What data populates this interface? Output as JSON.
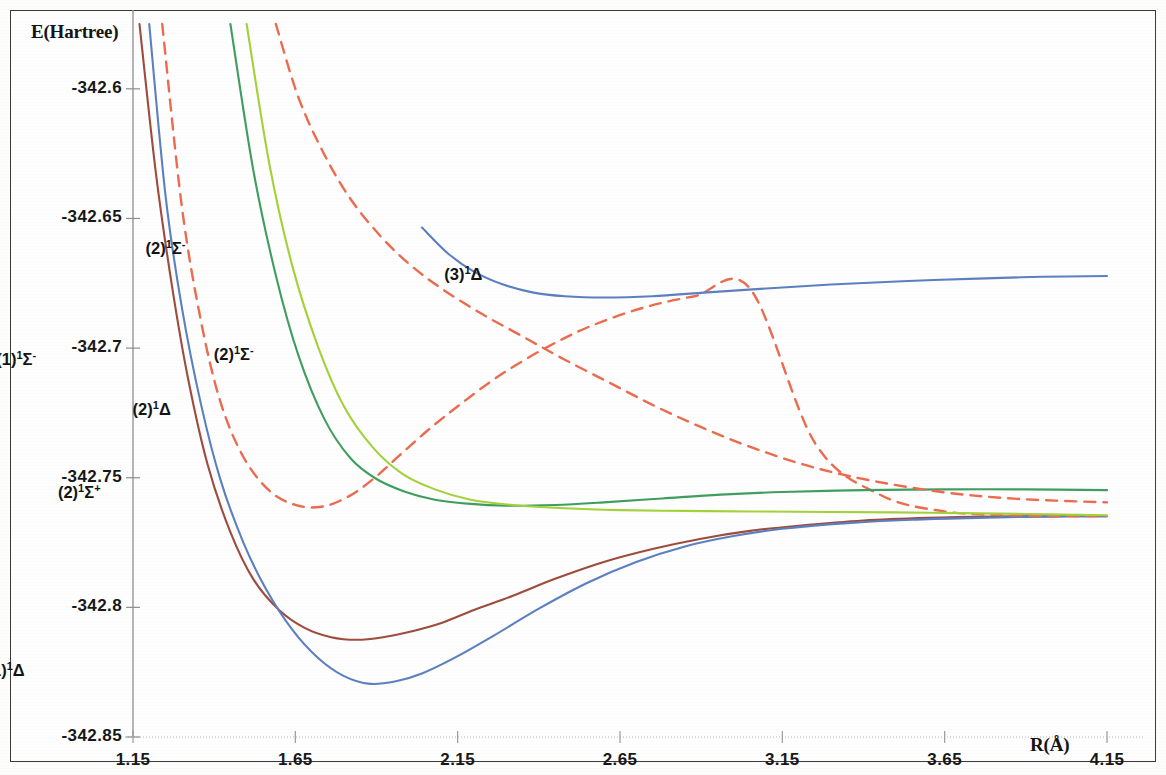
{
  "chart_data": {
    "type": "line",
    "title": "",
    "xlabel": "R(Å)",
    "ylabel": "E(Hartree)",
    "xlim": [
      1.15,
      4.15
    ],
    "ylim": [
      -342.85,
      -342.575
    ],
    "xticks": [
      "1.15",
      "1.65",
      "2.15",
      "2.65",
      "3.15",
      "3.65",
      "4.15"
    ],
    "xtick_values": [
      1.15,
      1.65,
      2.15,
      2.65,
      3.15,
      3.65,
      4.15
    ],
    "yticks": [
      "-342.6",
      "-342.65",
      "-342.7",
      "-342.75",
      "-342.8",
      "-342.85"
    ],
    "ytick_values": [
      -342.6,
      -342.65,
      -342.7,
      -342.75,
      -342.8,
      -342.85
    ],
    "grid": false,
    "legend": "inline-annotations",
    "series": [
      {
        "name": "(1)¹Σ⁺",
        "label_html": "(1)<sup>1</sup>Σ<sup>+</sup>",
        "color": "#9e4b3c",
        "style": "solid",
        "width": 2.1,
        "label_x": 0.545,
        "label_y": -342.8005,
        "points": [
          [
            1.17,
            -342.575
          ],
          [
            1.22,
            -342.632
          ],
          [
            1.27,
            -342.676
          ],
          [
            1.32,
            -342.712
          ],
          [
            1.38,
            -342.745
          ],
          [
            1.45,
            -342.771
          ],
          [
            1.52,
            -342.789
          ],
          [
            1.6,
            -342.801
          ],
          [
            1.68,
            -342.808
          ],
          [
            1.76,
            -342.8115
          ],
          [
            1.84,
            -342.8125
          ],
          [
            1.92,
            -342.8115
          ],
          [
            2.0,
            -342.8095
          ],
          [
            2.1,
            -342.806
          ],
          [
            2.2,
            -342.801
          ],
          [
            2.32,
            -342.7955
          ],
          [
            2.45,
            -342.789
          ],
          [
            2.6,
            -342.7825
          ],
          [
            2.75,
            -342.7775
          ],
          [
            2.9,
            -342.7735
          ],
          [
            3.05,
            -342.7705
          ],
          [
            3.2,
            -342.7685
          ],
          [
            3.4,
            -342.7665
          ],
          [
            3.6,
            -342.7655
          ],
          [
            3.8,
            -342.765
          ],
          [
            4.0,
            -342.7648
          ],
          [
            4.15,
            -342.7648
          ]
        ]
      },
      {
        "name": "(1)¹Δ",
        "label_html": "(1)<sup>1</sup>Δ",
        "color": "#5b7fc0",
        "style": "solid",
        "width": 2.1,
        "label_x": 0.705,
        "label_y": -342.8255,
        "points": [
          [
            1.2,
            -342.575
          ],
          [
            1.25,
            -342.641
          ],
          [
            1.3,
            -342.684
          ],
          [
            1.36,
            -342.722
          ],
          [
            1.42,
            -342.751
          ],
          [
            1.49,
            -342.775
          ],
          [
            1.56,
            -342.793
          ],
          [
            1.64,
            -342.8085
          ],
          [
            1.72,
            -342.8195
          ],
          [
            1.8,
            -342.8265
          ],
          [
            1.88,
            -342.8295
          ],
          [
            1.96,
            -342.8285
          ],
          [
            2.04,
            -342.8255
          ],
          [
            2.14,
            -342.8195
          ],
          [
            2.26,
            -342.811
          ],
          [
            2.4,
            -342.8005
          ],
          [
            2.55,
            -342.7905
          ],
          [
            2.7,
            -342.7825
          ],
          [
            2.85,
            -342.7765
          ],
          [
            3.0,
            -342.7725
          ],
          [
            3.15,
            -342.7697
          ],
          [
            3.35,
            -342.7675
          ],
          [
            3.55,
            -342.7662
          ],
          [
            3.75,
            -342.7655
          ],
          [
            3.95,
            -342.765
          ],
          [
            4.15,
            -342.7648
          ]
        ]
      },
      {
        "name": "(2)¹Σ⁺",
        "label_html": "(2)<sup>1</sup>Σ<sup>+</sup>",
        "color": "#ec6b4e",
        "style": "dashed",
        "width": 2.4,
        "label_x": 0.925,
        "label_y": -342.7565,
        "points": [
          [
            1.24,
            -342.575
          ],
          [
            1.3,
            -342.645
          ],
          [
            1.36,
            -342.69
          ],
          [
            1.42,
            -342.721
          ],
          [
            1.49,
            -342.742
          ],
          [
            1.57,
            -342.755
          ],
          [
            1.65,
            -342.7605
          ],
          [
            1.73,
            -342.7612
          ],
          [
            1.81,
            -342.7575
          ],
          [
            1.89,
            -342.7505
          ],
          [
            1.97,
            -342.7415
          ],
          [
            2.06,
            -342.7315
          ],
          [
            2.16,
            -342.7215
          ],
          [
            2.28,
            -342.7105
          ],
          [
            2.42,
            -342.7
          ],
          [
            2.56,
            -342.6915
          ],
          [
            2.72,
            -342.6845
          ],
          [
            2.88,
            -342.68
          ],
          [
            3.05,
            -342.677
          ],
          [
            3.25,
            -342.7365
          ],
          [
            3.45,
            -342.7565
          ],
          [
            3.65,
            -342.763
          ],
          [
            3.85,
            -342.7645
          ],
          [
            4.05,
            -342.7648
          ],
          [
            4.15,
            -342.7648
          ]
        ],
        "note": "upper branch crosses from repulsive wall to dissociation limit"
      },
      {
        "name": "(1)¹Σ⁻",
        "label_html": "(1)<sup>1</sup>Σ<sup>-</sup>",
        "color": "#3f9e5e",
        "style": "solid",
        "width": 2.1,
        "label_x": 0.735,
        "label_y": -342.7055,
        "points": [
          [
            1.45,
            -342.575
          ],
          [
            1.52,
            -342.631
          ],
          [
            1.59,
            -342.672
          ],
          [
            1.66,
            -342.703
          ],
          [
            1.74,
            -342.7275
          ],
          [
            1.82,
            -342.7425
          ],
          [
            1.9,
            -342.7505
          ],
          [
            1.99,
            -342.7555
          ],
          [
            2.08,
            -342.7585
          ],
          [
            2.18,
            -342.76
          ],
          [
            2.3,
            -342.7608
          ],
          [
            2.45,
            -342.7605
          ],
          [
            2.6,
            -342.7595
          ],
          [
            2.78,
            -342.758
          ],
          [
            2.96,
            -342.7565
          ],
          [
            3.15,
            -342.7555
          ],
          [
            3.4,
            -342.7548
          ],
          [
            3.65,
            -342.7545
          ],
          [
            3.9,
            -342.7545
          ],
          [
            4.15,
            -342.7548
          ]
        ]
      },
      {
        "name": "(2)¹Δ",
        "label_html": "(2)<sup>1</sup>Δ",
        "color": "#a3d13a",
        "style": "solid",
        "width": 2.1,
        "label_x": 1.155,
        "label_y": -342.7245,
        "points": [
          [
            1.5,
            -342.575
          ],
          [
            1.57,
            -342.629
          ],
          [
            1.64,
            -342.668
          ],
          [
            1.72,
            -342.6995
          ],
          [
            1.8,
            -342.7225
          ],
          [
            1.89,
            -342.7385
          ],
          [
            1.98,
            -342.7485
          ],
          [
            2.08,
            -342.7545
          ],
          [
            2.19,
            -342.7585
          ],
          [
            2.32,
            -342.7605
          ],
          [
            2.48,
            -342.7618
          ],
          [
            2.65,
            -342.7625
          ],
          [
            2.85,
            -342.7628
          ],
          [
            3.05,
            -342.763
          ],
          [
            3.3,
            -342.7632
          ],
          [
            3.6,
            -342.7635
          ],
          [
            3.9,
            -342.764
          ],
          [
            4.15,
            -342.7645
          ]
        ]
      },
      {
        "name": "(2)¹Σ⁻",
        "label_html": "(2)<sup>1</sup>Σ<sup>-</sup>",
        "color": "#ec6b4e",
        "style": "dashed",
        "width": 2.4,
        "label_x": 1.195,
        "label_y": -342.6625,
        "label2_x": 1.405,
        "label2_y": -342.7035,
        "points": [
          [
            1.59,
            -342.575
          ],
          [
            1.66,
            -342.6035
          ],
          [
            1.74,
            -342.6255
          ],
          [
            1.82,
            -342.6425
          ],
          [
            1.91,
            -342.6565
          ],
          [
            2.0,
            -342.6675
          ],
          [
            2.1,
            -342.677
          ],
          [
            2.22,
            -342.6865
          ],
          [
            2.35,
            -342.6955
          ],
          [
            2.48,
            -342.7045
          ],
          [
            2.62,
            -342.7135
          ],
          [
            2.76,
            -342.7225
          ],
          [
            2.9,
            -342.7305
          ],
          [
            3.06,
            -342.7385
          ],
          [
            3.24,
            -342.7458
          ],
          [
            3.44,
            -342.7515
          ],
          [
            3.66,
            -342.7558
          ],
          [
            3.88,
            -342.7582
          ],
          [
            4.15,
            -342.7595
          ]
        ]
      },
      {
        "name": "(3)¹Δ",
        "label_html": "(3)<sup>1</sup>Δ",
        "color": "#5b7fc0",
        "style": "solid",
        "width": 2.1,
        "label_x": 2.115,
        "label_y": -342.6725,
        "points": [
          [
            2.04,
            -342.6535
          ],
          [
            2.12,
            -342.6635
          ],
          [
            2.2,
            -342.6705
          ],
          [
            2.29,
            -342.6755
          ],
          [
            2.38,
            -342.6785
          ],
          [
            2.48,
            -342.68
          ],
          [
            2.6,
            -342.6805
          ],
          [
            2.75,
            -342.68
          ],
          [
            2.92,
            -342.6785
          ],
          [
            3.1,
            -342.677
          ],
          [
            3.3,
            -342.6755
          ],
          [
            3.52,
            -342.6742
          ],
          [
            3.75,
            -342.6732
          ],
          [
            3.95,
            -342.6725
          ],
          [
            4.15,
            -342.6722
          ]
        ]
      }
    ]
  },
  "axes": {
    "y_axis_title": "E(Hartree)",
    "x_axis_title": "R(Å)"
  }
}
